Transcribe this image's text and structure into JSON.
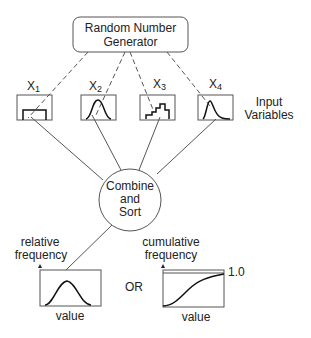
{
  "generator": {
    "line1": "Random Number",
    "line2": "Generator"
  },
  "inputs": [
    {
      "name": "X",
      "sub": "1",
      "shape": "uniform"
    },
    {
      "name": "X",
      "sub": "2",
      "shape": "normal"
    },
    {
      "name": "X",
      "sub": "3",
      "shape": "step-histogram"
    },
    {
      "name": "X",
      "sub": "4",
      "shape": "skewed"
    }
  ],
  "input_label": {
    "line1": "Input",
    "line2": "Variables"
  },
  "combine": {
    "line1": "Combine",
    "line2": "and",
    "line3": "Sort"
  },
  "outputs": {
    "relative": {
      "ylabel1": "relative",
      "ylabel2": "frequency",
      "xlabel": "value"
    },
    "or_label": "OR",
    "cumulative": {
      "ylabel1": "cumulative",
      "ylabel2": "frequency",
      "xlabel": "value",
      "max_label": "1.0"
    }
  },
  "colors": {
    "line": "#555555",
    "curve": "#111111",
    "text": "#222222"
  }
}
